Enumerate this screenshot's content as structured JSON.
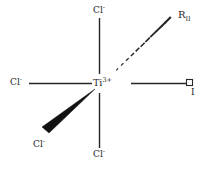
{
  "diagram": {
    "type": "chemical-structure",
    "background_color": "#ffffff",
    "line_color": "#262626",
    "center": {
      "element": "Ti",
      "charge": "3+",
      "label": "Ti",
      "x": 104,
      "y": 84
    },
    "ligands": [
      {
        "id": "cl-top",
        "label": "Cl",
        "charge": "-",
        "bond": "plain",
        "direction": "up",
        "label_x": 93,
        "label_y": 6
      },
      {
        "id": "cl-left",
        "label": "Cl",
        "charge": "-",
        "bond": "plain",
        "direction": "left",
        "label_x": 10,
        "label_y": 78
      },
      {
        "id": "cl-bottom",
        "label": "Cl",
        "charge": "-",
        "bond": "plain",
        "direction": "down",
        "label_x": 93,
        "label_y": 150
      },
      {
        "id": "cl-wedge",
        "label": "Cl",
        "charge": "-",
        "bond": "bold-wedge",
        "direction": "down-left",
        "label_x": 33,
        "label_y": 140
      },
      {
        "id": "r-two",
        "label": "R",
        "subscript": "II",
        "bond": "hashed-wedge",
        "direction": "up-right",
        "label_x": 178,
        "label_y": 10
      },
      {
        "id": "vacant-site",
        "label": "I",
        "bond": "plain",
        "direction": "right",
        "marker": "open-square",
        "marker_x": 189,
        "marker_y": 79,
        "label_x": 192,
        "label_y": 88
      }
    ],
    "hash_count": 11
  }
}
